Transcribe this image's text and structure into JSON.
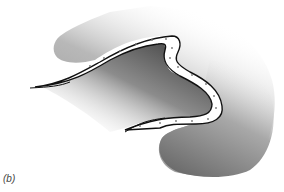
{
  "figure": {
    "panel_label": "(b)",
    "colors": {
      "background": "#ffffff",
      "shade_dark": "#6e6e6e",
      "shade_mid": "#a6a6a6",
      "band_fill": "#ffffff",
      "band_edge": "#111111",
      "dots": "#777777"
    }
  }
}
